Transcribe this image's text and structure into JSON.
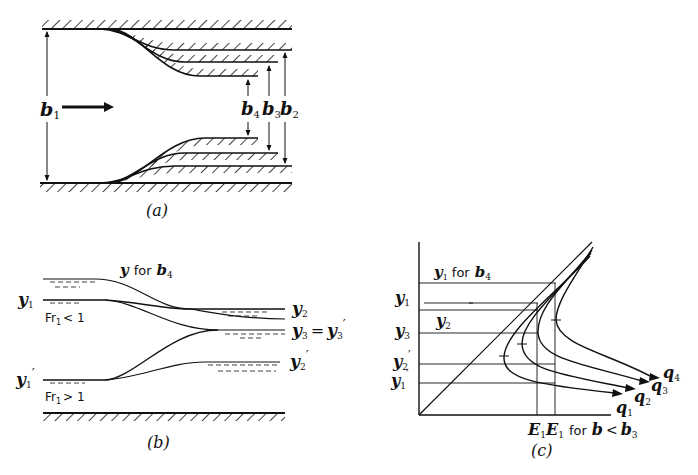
{
  "panel_a": {
    "caption": "(a)",
    "labels": {
      "b1": "b",
      "b1_sub": "1",
      "b2": "b",
      "b2_sub": "2",
      "b3": "b",
      "b3_sub": "3",
      "b4": "b",
      "b4_sub": "4"
    }
  },
  "panel_b": {
    "caption": "(b)",
    "title_y": "y",
    "title_for": "for",
    "title_b": "b",
    "title_b_sub": "4",
    "y1": "y",
    "y1_sub": "1",
    "y1p": "y",
    "y1p_sub": "1",
    "y1p_prime": "′",
    "y2": "y",
    "y2_sub": "2",
    "y2p": "y",
    "y2p_sub": "2",
    "y2p_prime": "′",
    "y3": "y",
    "y3_sub": "3",
    "eq": "=",
    "y3p": "y",
    "y3p_sub": "3",
    "y3p_prime": "′",
    "fr_sub": "Fr",
    "fr_sub_idx": "1",
    "fr_sub_rel": "< 1",
    "fr_super": "Fr",
    "fr_super_idx": "1",
    "fr_super_rel": "> 1"
  },
  "panel_c": {
    "caption": "(c)",
    "top_label_y": "y",
    "top_label_sub": "1",
    "top_label_for": "for",
    "top_label_b": "b",
    "top_label_b_sub": "4",
    "y_axis_labels": [
      {
        "t": "y",
        "s": "1",
        "p": ""
      },
      {
        "t": "y",
        "s": "3",
        "p": ""
      },
      {
        "t": "y",
        "s": "2",
        "p": "′"
      },
      {
        "t": "y",
        "s": "1",
        "p": "′"
      }
    ],
    "inner_y2": "y",
    "inner_y2_sub": "2",
    "x_label_E1a": "E",
    "x_label_E1a_sub": "1",
    "x_label_E1b": "E",
    "x_label_E1b_sub": "1",
    "x_label_for": "for",
    "x_label_b": "b",
    "x_label_lt": "<",
    "x_label_b3": "b",
    "x_label_b3_sub": "3",
    "curves": [
      {
        "t": "q",
        "s": "1"
      },
      {
        "t": "q",
        "s": "2"
      },
      {
        "t": "q",
        "s": "3"
      },
      {
        "t": "q",
        "s": "4"
      }
    ]
  }
}
